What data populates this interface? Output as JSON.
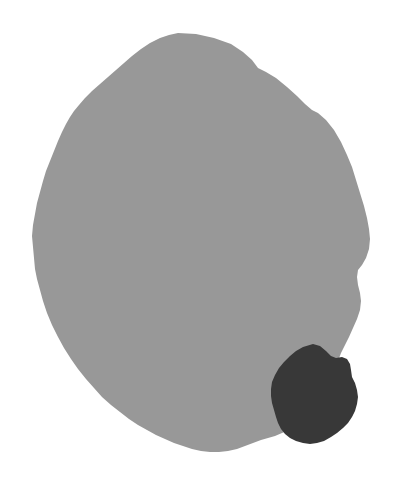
{
  "image": {
    "kind": "segmentation-mask",
    "width": 394,
    "height": 484,
    "background_color": "#ffffff",
    "label_count": 2,
    "alt_text": "Binary segmentation mask: a large medium-gray ovoid region occupying most of the frame with a smaller dark-gray blob region at its lower right."
  },
  "regions": [
    {
      "id": "region-1",
      "name": "primary-region",
      "color": "#989898",
      "gray_level": 152,
      "role": "main-mask",
      "bbox": {
        "x": 32,
        "y": 33,
        "width": 338,
        "height": 419
      },
      "centroid": {
        "x": 196,
        "y": 245
      },
      "path": "M 178 33 L 196 34 L 214 38 L 231 44 L 243 52 L 252 60 L 258 68 L 266 72 L 276 78 L 287 87 L 297 96 L 305 104 L 312 110 L 318 113 L 326 120 L 334 130 L 341 142 L 347 155 L 352 167 L 356 180 L 360 193 L 364 206 L 367 218 L 369 229 L 370 239 L 369 249 L 366 258 L 362 265 L 358 270 L 357 277 L 358 285 L 360 293 L 361 301 L 360 310 L 357 319 L 353 328 L 349 337 L 345 345 L 341 353 L 338 361 L 336 370 L 334 379 L 331 388 L 327 396 L 322 403 L 316 410 L 310 416 L 303 421 L 296 426 L 289 430 L 282 433 L 275 436 L 268 438 L 261 440 L 253 443 L 245 446 L 237 449 L 228 451 L 219 452 L 210 452 L 201 451 L 192 449 L 183 446 L 174 443 L 165 439 L 156 435 L 147 430 L 138 425 L 129 419 L 120 412 L 111 405 L 102 397 L 94 388 L 86 379 L 78 369 L 71 359 L 64 348 L 58 337 L 52 325 L 47 313 L 43 301 L 40 290 L 37 279 L 35 269 L 34 258 L 33 247 L 32 236 L 33 225 L 35 214 L 37 203 L 40 192 L 43 181 L 46 171 L 50 161 L 54 151 L 58 141 L 62 132 L 66 124 L 70 117 L 74 111 L 79 105 L 85 98 L 92 91 L 100 84 L 108 77 L 116 70 L 124 63 L 132 56 L 141 49 L 150 43 L 160 38 L 169 35 Z"
    },
    {
      "id": "region-2",
      "name": "secondary-region",
      "color": "#383838",
      "gray_level": 56,
      "role": "inset-mask",
      "bbox": {
        "x": 271,
        "y": 344,
        "width": 87,
        "height": 100
      },
      "centroid": {
        "x": 315,
        "y": 395
      },
      "path": "M 313 344 L 320 346 L 326 351 L 331 356 L 336 358 L 342 357 L 347 359 L 350 364 L 351 370 L 352 377 L 355 383 L 357 390 L 358 397 L 357 404 L 355 411 L 352 417 L 348 423 L 343 428 L 337 433 L 331 437 L 324 441 L 317 443 L 310 444 L 303 443 L 296 441 L 290 438 L 285 434 L 281 429 L 278 423 L 276 417 L 274 410 L 272 403 L 271 396 L 271 389 L 272 382 L 275 375 L 279 368 L 284 362 L 290 356 L 296 351 L 303 347 Z"
    }
  ],
  "legend": {
    "title": "Mask labels",
    "entries": [
      {
        "label": "Background",
        "color": "#ffffff",
        "value": "0"
      },
      {
        "label": "Primary region",
        "color": "#989898",
        "value": "152"
      },
      {
        "label": "Secondary region",
        "color": "#383838",
        "value": "56"
      }
    ]
  }
}
